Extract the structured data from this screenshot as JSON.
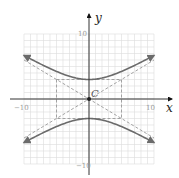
{
  "chart_data": {
    "type": "line",
    "title": "",
    "xlabel": "x",
    "ylabel": "y",
    "xlim": [
      -10,
      10
    ],
    "ylim": [
      -10,
      10
    ],
    "grid": true,
    "grid_step": 1,
    "tick_labels": {
      "x_min": "−10",
      "x_max": "10",
      "y_max": "10",
      "y_min": "−10"
    },
    "center_label": "C",
    "center": [
      0,
      0
    ],
    "equation": "y^2/9 - x^2/25 = 1",
    "a": 5,
    "b": 3,
    "series": [
      {
        "name": "upper branch",
        "style": "solid",
        "x": [
          -10,
          -8,
          -6,
          -4,
          -2,
          0,
          2,
          4,
          6,
          8,
          10
        ],
        "y": [
          6.71,
          5.66,
          4.69,
          3.84,
          3.23,
          3.0,
          3.23,
          3.84,
          4.69,
          5.66,
          6.71
        ]
      },
      {
        "name": "lower branch",
        "style": "solid",
        "x": [
          -10,
          -8,
          -6,
          -4,
          -2,
          0,
          2,
          4,
          6,
          8,
          10
        ],
        "y": [
          -6.71,
          -5.66,
          -4.69,
          -3.84,
          -3.23,
          -3.0,
          -3.23,
          -3.84,
          -4.69,
          -5.66,
          -6.71
        ]
      },
      {
        "name": "asymptote y = 3/5 x",
        "style": "dashed",
        "x": [
          -10,
          10
        ],
        "y": [
          -6,
          6
        ]
      },
      {
        "name": "asymptote y = -3/5 x",
        "style": "dashed",
        "x": [
          -10,
          10
        ],
        "y": [
          6,
          -6
        ]
      }
    ],
    "fundamental_rectangle": {
      "x": [
        -5,
        5
      ],
      "y": [
        -3,
        3
      ],
      "style": "dashed"
    }
  },
  "colors": {
    "grid": "#dcdcdc",
    "axis": "#333333",
    "curve": "#6b6b6b",
    "dashed": "#9a9a9a"
  }
}
